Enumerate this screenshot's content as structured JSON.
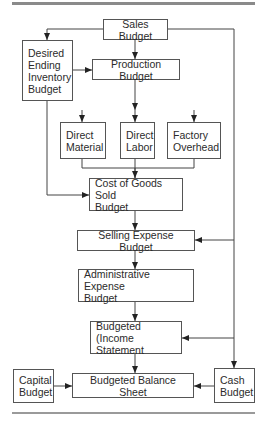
{
  "diagram": {
    "type": "flowchart",
    "nodes": [
      {
        "id": "sales",
        "label": "Sales Budget",
        "x": 103,
        "y": 19,
        "w": 65,
        "h": 21,
        "align": "center"
      },
      {
        "id": "deib",
        "label": "Desired\nEnding\nInventory\nBudget",
        "x": 22,
        "y": 40,
        "w": 51,
        "h": 61,
        "align": "left"
      },
      {
        "id": "production",
        "label": "Production Budget",
        "x": 92,
        "y": 59,
        "w": 88,
        "h": 21,
        "align": "center"
      },
      {
        "id": "material",
        "label": "Direct\nMaterial",
        "x": 60,
        "y": 122,
        "w": 46,
        "h": 37,
        "align": "left"
      },
      {
        "id": "labor",
        "label": "Direct\nLabor",
        "x": 120,
        "y": 122,
        "w": 35,
        "h": 37,
        "align": "left"
      },
      {
        "id": "overhead",
        "label": "Factory\nOverhead",
        "x": 167,
        "y": 122,
        "w": 54,
        "h": 37,
        "align": "left"
      },
      {
        "id": "cogs",
        "label": "Cost of Goods Sold\nBudget",
        "x": 89,
        "y": 178,
        "w": 94,
        "h": 33,
        "align": "left"
      },
      {
        "id": "selling",
        "label": "Selling Expense Budget",
        "x": 77,
        "y": 230,
        "w": 118,
        "h": 21,
        "align": "center"
      },
      {
        "id": "admin",
        "label": "Administrative Expense\nBudget",
        "x": 78,
        "y": 269,
        "w": 116,
        "h": 33,
        "align": "left"
      },
      {
        "id": "income",
        "label": "Budgeted (Income\nStatement",
        "x": 90,
        "y": 321,
        "w": 92,
        "h": 33,
        "align": "left"
      },
      {
        "id": "capital",
        "label": "Capital\nBudget",
        "x": 13,
        "y": 369,
        "w": 41,
        "h": 34,
        "align": "left"
      },
      {
        "id": "balance",
        "label": "Budgeted Balance Sheet",
        "x": 72,
        "y": 373,
        "w": 122,
        "h": 25,
        "align": "center"
      },
      {
        "id": "cash",
        "label": "Cash\nBudget",
        "x": 214,
        "y": 368,
        "w": 41,
        "h": 35,
        "align": "left"
      }
    ],
    "edges": [
      {
        "from": "sales",
        "to": "deib",
        "points": [
          [
            103,
            29
          ],
          [
            47,
            29
          ],
          [
            47,
            40
          ]
        ]
      },
      {
        "from": "sales",
        "to": "production",
        "points": [
          [
            135,
            40
          ],
          [
            135,
            59
          ]
        ]
      },
      {
        "from": "sales",
        "to": "cash",
        "points": [
          [
            168,
            29
          ],
          [
            234,
            29
          ],
          [
            234,
            368
          ]
        ]
      },
      {
        "from": "deib",
        "to": "production",
        "points": [
          [
            73,
            70
          ],
          [
            92,
            70
          ]
        ]
      },
      {
        "from": "production",
        "to": "branch",
        "points": [
          [
            135,
            80
          ],
          [
            135,
            110
          ]
        ]
      },
      {
        "from": "branch",
        "to": "material",
        "points": [
          [
            82,
            110
          ],
          [
            82,
            122
          ]
        ]
      },
      {
        "from": "branch",
        "to": "labor",
        "points": [
          [
            135,
            110
          ],
          [
            135,
            122
          ]
        ]
      },
      {
        "from": "branch",
        "to": "overhead",
        "points": [
          [
            194,
            110
          ],
          [
            194,
            122
          ]
        ]
      },
      {
        "from": "material",
        "to": "cogs",
        "points": [
          [
            82,
            159
          ],
          [
            82,
            168
          ],
          [
            135,
            168
          ],
          [
            135,
            178
          ]
        ]
      },
      {
        "from": "labor",
        "to": "cogs",
        "points": [
          [
            135,
            159
          ],
          [
            135,
            178
          ]
        ]
      },
      {
        "from": "overhead",
        "to": "cogs",
        "points": [
          [
            194,
            159
          ],
          [
            194,
            168
          ],
          [
            135,
            168
          ]
        ]
      },
      {
        "from": "deib",
        "to": "cogs",
        "points": [
          [
            47,
            101
          ],
          [
            47,
            195
          ],
          [
            89,
            195
          ]
        ]
      },
      {
        "from": "cogs",
        "to": "selling",
        "points": [
          [
            135,
            211
          ],
          [
            135,
            230
          ]
        ]
      },
      {
        "from": "sales",
        "to": "selling",
        "points": [
          [
            234,
            240
          ],
          [
            195,
            240
          ]
        ]
      },
      {
        "from": "selling",
        "to": "admin",
        "points": [
          [
            135,
            251
          ],
          [
            135,
            269
          ]
        ]
      },
      {
        "from": "admin",
        "to": "income",
        "points": [
          [
            135,
            302
          ],
          [
            135,
            321
          ]
        ]
      },
      {
        "from": "sales",
        "to": "income",
        "points": [
          [
            234,
            338
          ],
          [
            182,
            338
          ]
        ]
      },
      {
        "from": "income",
        "to": "balance",
        "points": [
          [
            135,
            354
          ],
          [
            135,
            373
          ]
        ]
      },
      {
        "from": "capital",
        "to": "balance",
        "points": [
          [
            54,
            386
          ],
          [
            72,
            386
          ]
        ]
      },
      {
        "from": "cash",
        "to": "balance",
        "points": [
          [
            214,
            386
          ],
          [
            194,
            386
          ]
        ]
      }
    ],
    "arrowheads": [
      [
        [
          47,
          40
        ],
        "down"
      ],
      [
        [
          135,
          59
        ],
        "down"
      ],
      [
        [
          92,
          70
        ],
        "right"
      ],
      [
        [
          135,
          110
        ],
        "down"
      ],
      [
        [
          82,
          122
        ],
        "down"
      ],
      [
        [
          135,
          122
        ],
        "down"
      ],
      [
        [
          194,
          122
        ],
        "down"
      ],
      [
        [
          135,
          178
        ],
        "down"
      ],
      [
        [
          89,
          195
        ],
        "right"
      ],
      [
        [
          135,
          230
        ],
        "down"
      ],
      [
        [
          195,
          240
        ],
        "left"
      ],
      [
        [
          135,
          269
        ],
        "down"
      ],
      [
        [
          135,
          321
        ],
        "down"
      ],
      [
        [
          182,
          338
        ],
        "left"
      ],
      [
        [
          135,
          373
        ],
        "down"
      ],
      [
        [
          72,
          386
        ],
        "right"
      ],
      [
        [
          194,
          386
        ],
        "left"
      ],
      [
        [
          234,
          368
        ],
        "down"
      ]
    ]
  },
  "colors": {
    "line": "#444444",
    "border": "#555555",
    "rule": "#8a8a8a",
    "text": "#2b2b2b"
  }
}
